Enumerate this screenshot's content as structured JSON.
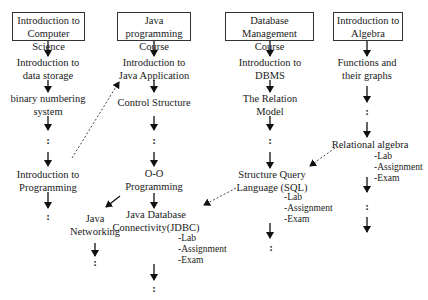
{
  "diagram": {
    "columns": [
      {
        "header": {
          "line1": "Introduction to",
          "line2": "Computer Science"
        },
        "nodes": [
          {
            "line1": "Introduction to",
            "line2": "data storage"
          },
          {
            "line1": "binary numbering",
            "line2": "system"
          },
          {
            "line1": ":"
          },
          {
            "line1": "Introduction to",
            "line2": "Programming"
          },
          {
            "line1": ":"
          }
        ]
      },
      {
        "header": {
          "line1": "Java programming",
          "line2": "Course"
        },
        "nodes": [
          {
            "line1": "Introduction to",
            "line2": "Java Application"
          },
          {
            "line1": "Control Structure"
          },
          {
            "line1": ":"
          },
          {
            "line1": "O-O",
            "line2": "Programming"
          },
          {
            "line1": "Java Database",
            "line2": "Connectivity(JDBC)",
            "sub": [
              "-Lab",
              "-Assignment",
              "-Exam"
            ]
          },
          {
            "line1": ":"
          }
        ],
        "branch": [
          {
            "line1": "Java",
            "line2": "Networking"
          },
          {
            "line1": ":"
          }
        ]
      },
      {
        "header": {
          "line1": "Database Management",
          "line2": "Course"
        },
        "nodes": [
          {
            "line1": "Introduction to",
            "line2": "DBMS"
          },
          {
            "line1": "The Relation",
            "line2": "Model"
          },
          {
            "line1": ":"
          },
          {
            "line1": "Structure Query",
            "line2": "Language (SQL)",
            "sub": [
              "-Lab",
              "-Assignment",
              "-Exam"
            ]
          },
          {
            "line1": ":"
          }
        ]
      },
      {
        "header": {
          "line1": "Introduction to",
          "line2": "Algebra"
        },
        "nodes": [
          {
            "line1": "Functions and",
            "line2": "their graphs"
          },
          {
            "line1": ":"
          },
          {
            "line1": "Relational algebra",
            "sub": [
              "-Lab",
              "-Assignment",
              "-Exam"
            ]
          },
          {
            "line1": ":"
          }
        ]
      }
    ],
    "cross_links": [
      {
        "from": "Introduction to Programming",
        "to": "Introduction to Java Application",
        "style": "dotted"
      },
      {
        "from": "Relational algebra",
        "to": "Structure Query Language (SQL)",
        "style": "dotted"
      },
      {
        "from": "Structure Query Language (SQL)",
        "to": "Java Database Connectivity(JDBC)",
        "style": "dotted"
      },
      {
        "from": "O-O Programming",
        "to": "Java Networking",
        "style": "solid"
      }
    ]
  }
}
